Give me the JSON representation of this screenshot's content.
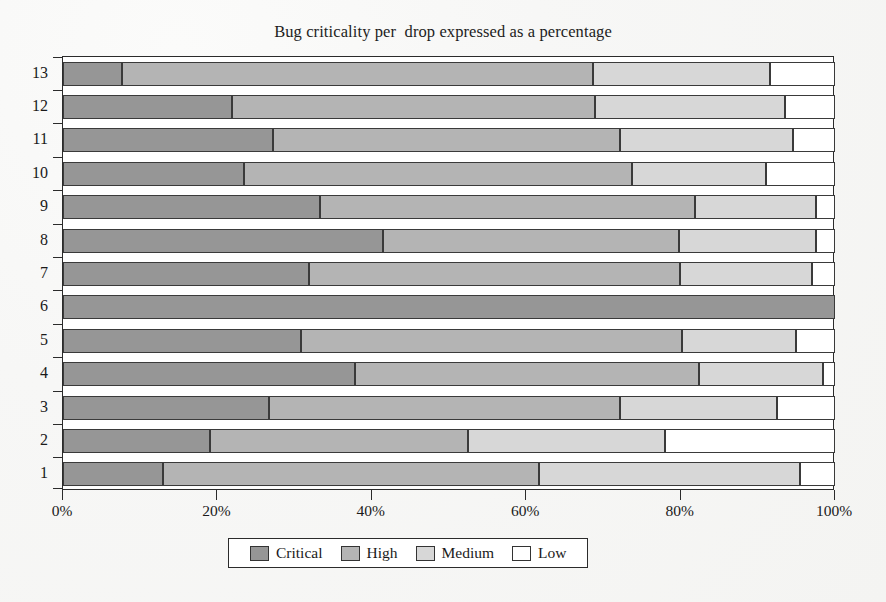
{
  "chart_data": {
    "type": "bar",
    "orientation": "horizontal",
    "stacked": true,
    "normalized_percent": true,
    "title": "Bug criticality per  drop expressed as a percentage",
    "xlabel": "",
    "ylabel": "",
    "xlim": [
      0,
      100
    ],
    "xticks": [
      0,
      20,
      40,
      60,
      80,
      100
    ],
    "xticklabels": [
      "0%",
      "20%",
      "40%",
      "60%",
      "80%",
      "100%"
    ],
    "categories": [
      "1",
      "2",
      "3",
      "4",
      "5",
      "6",
      "7",
      "8",
      "9",
      "10",
      "11",
      "12",
      "13"
    ],
    "category_order_top_to_bottom": [
      "13",
      "12",
      "11",
      "10",
      "9",
      "8",
      "7",
      "6",
      "5",
      "4",
      "3",
      "2",
      "1"
    ],
    "grid": false,
    "legend_position": "bottom",
    "series": [
      {
        "name": "Critical",
        "color": "#969696",
        "values": [
          13.0,
          19.0,
          26.7,
          37.8,
          30.8,
          100.0,
          31.9,
          41.4,
          33.3,
          23.4,
          27.2,
          21.9,
          7.6
        ]
      },
      {
        "name": "High",
        "color": "#b4b4b4",
        "values": [
          48.6,
          33.4,
          45.4,
          44.6,
          49.4,
          0.0,
          48.0,
          38.4,
          48.6,
          50.3,
          45.0,
          47.0,
          61.1
        ]
      },
      {
        "name": "Medium",
        "color": "#d7d7d7",
        "values": [
          33.9,
          25.6,
          20.4,
          16.1,
          14.8,
          0.0,
          17.1,
          17.7,
          15.6,
          17.3,
          22.3,
          24.6,
          22.9
        ]
      },
      {
        "name": "Low",
        "color": "#ffffff",
        "values": [
          4.5,
          22.0,
          7.5,
          1.5,
          5.0,
          0.0,
          3.0,
          2.5,
          2.5,
          9.0,
          5.5,
          6.5,
          8.4
        ]
      }
    ]
  },
  "legend": {
    "entries": [
      {
        "label": "Critical",
        "swatch": "legend-swatch-critical"
      },
      {
        "label": "High",
        "swatch": "legend-swatch-high"
      },
      {
        "label": "Medium",
        "swatch": "legend-swatch-medium"
      },
      {
        "label": "Low",
        "swatch": "legend-swatch-low"
      }
    ]
  }
}
